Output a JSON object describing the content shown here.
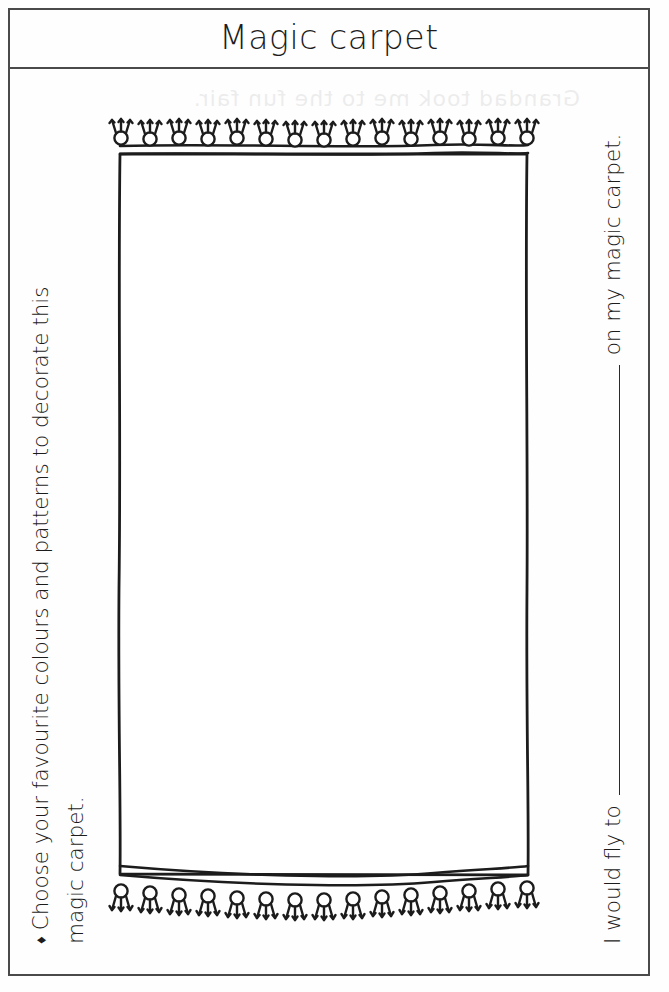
{
  "page": {
    "title": "Magic carpet",
    "ghost_bleed_text": "Grandad took me to the fun fair."
  },
  "instruction": {
    "bullet": "♦",
    "line1": "Choose your favourite colours and patterns to decorate this",
    "line2": "magic carpet."
  },
  "prompt": {
    "before_blank": "I would fly to",
    "after_blank": "on my magic carpet.",
    "blank_answer": ""
  },
  "carpet": {
    "label": "magic-carpet-illustration",
    "tassel_count_top": 15,
    "tassel_count_bottom": 15,
    "stroke_color": "#1c1c1c",
    "fill_color": "#ffffff",
    "body_width_px": 424,
    "body_height_px": 722
  },
  "colors": {
    "ink": "#1c1c1c",
    "frame": "#4a4a4a",
    "paper": "#fefefe",
    "rule": "#2a2a2a"
  }
}
